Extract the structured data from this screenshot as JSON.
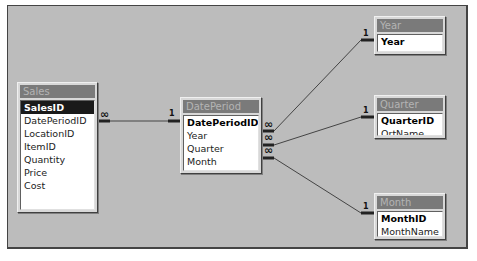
{
  "diagram": {
    "tables": [
      {
        "id": "sales",
        "title": "Sales",
        "fields": [
          {
            "name": "SalesID",
            "key": true,
            "selected": true
          },
          {
            "name": "DatePeriodID"
          },
          {
            "name": "LocationID"
          },
          {
            "name": "ItemID"
          },
          {
            "name": "Quantity"
          },
          {
            "name": "Price"
          },
          {
            "name": "Cost"
          }
        ]
      },
      {
        "id": "dateperiod",
        "title": "DatePeriod",
        "fields": [
          {
            "name": "DatePeriodID",
            "key": true
          },
          {
            "name": "Year"
          },
          {
            "name": "Quarter"
          },
          {
            "name": "Month"
          }
        ]
      },
      {
        "id": "year",
        "title": "Year",
        "fields": [
          {
            "name": "Year",
            "key": true
          }
        ]
      },
      {
        "id": "quarter",
        "title": "Quarter",
        "fields": [
          {
            "name": "QuarterID",
            "key": true
          },
          {
            "name": "QrtName"
          }
        ]
      },
      {
        "id": "month",
        "title": "Month",
        "fields": [
          {
            "name": "MonthID",
            "key": true
          },
          {
            "name": "MonthName"
          }
        ]
      }
    ],
    "relationships": [
      {
        "from": "Sales.DatePeriodID",
        "to": "DatePeriod.DatePeriodID",
        "from_card": "∞",
        "to_card": "1"
      },
      {
        "from": "DatePeriod.Year",
        "to": "Year.Year",
        "from_card": "∞",
        "to_card": "1"
      },
      {
        "from": "DatePeriod.Quarter",
        "to": "Quarter.QuarterID",
        "from_card": "∞",
        "to_card": "1"
      },
      {
        "from": "DatePeriod.Month",
        "to": "Month.MonthID",
        "from_card": "∞",
        "to_card": "1"
      }
    ],
    "colors": {
      "canvas": "#bcbcbc",
      "title_bar": "#7a7a7a",
      "title_text": "#b4b4b4",
      "line": "#333333"
    }
  }
}
